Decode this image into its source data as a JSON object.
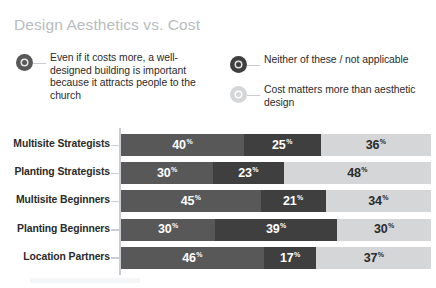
{
  "title": "Design Aesthetics vs. Cost",
  "colors": {
    "background": "#ffffff",
    "title": "#b9bcc0",
    "axis": "#c9ccd0",
    "series_dark": "#585858",
    "series_mid": "#3f3f3f",
    "series_light": "#d4d6d8",
    "label_text": "#2b2b2b",
    "value_on_dark": "#ffffff",
    "value_on_light": "#2b2b2b"
  },
  "legend": {
    "items": [
      {
        "marker": "legend-dot-dark",
        "color": "#585858",
        "label": "Even if it costs more, a well-designed building is important because it attracts people to the church"
      },
      {
        "marker": "legend-dot-mid",
        "color": "#3f3f3f",
        "label": "Neither of these / not applicable"
      },
      {
        "marker": "legend-dot-light",
        "color": "#d4d6d8",
        "label": "Cost matters more than aesthetic design"
      }
    ]
  },
  "percent_symbol": "%",
  "chart_data": {
    "type": "bar",
    "title": "Design Aesthetics vs. Cost",
    "xlabel": "",
    "ylabel": "",
    "orientation": "horizontal",
    "stacked": true,
    "stack_total": 100,
    "xlim": [
      0,
      100
    ],
    "grid": false,
    "legend_position": "top",
    "value_suffix": "%",
    "categories": [
      "Multisite Strategists",
      "Planting Strategists",
      "Multisite Beginners",
      "Planting Beginners",
      "Location Partners"
    ],
    "series": [
      {
        "name": "Even if it costs more, a well-designed building is important because it attracts people to the church",
        "color": "#585858",
        "values": [
          40,
          30,
          45,
          30,
          46
        ]
      },
      {
        "name": "Neither of these / not applicable",
        "color": "#3f3f3f",
        "values": [
          25,
          23,
          21,
          39,
          17
        ]
      },
      {
        "name": "Cost matters more than aesthetic design",
        "color": "#d4d6d8",
        "values": [
          36,
          48,
          34,
          30,
          37
        ]
      }
    ]
  }
}
